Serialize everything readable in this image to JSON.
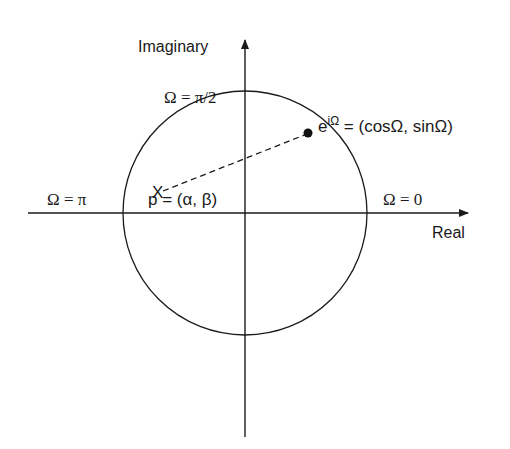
{
  "diagram": {
    "axes": {
      "x_label": "Real",
      "y_label": "Imaginary"
    },
    "angle_labels": {
      "top": "Ω = π/2",
      "left": "Ω = π",
      "right": "Ω = 0"
    },
    "point_on_circle": {
      "base": "e",
      "exponent": "iΩ",
      "rest": " = (cosΩ, sinΩ)"
    },
    "pole": {
      "marker": "X",
      "label": "p = (α, β)"
    },
    "colors": {
      "stroke": "#1a1a1a",
      "background": "#ffffff"
    }
  }
}
